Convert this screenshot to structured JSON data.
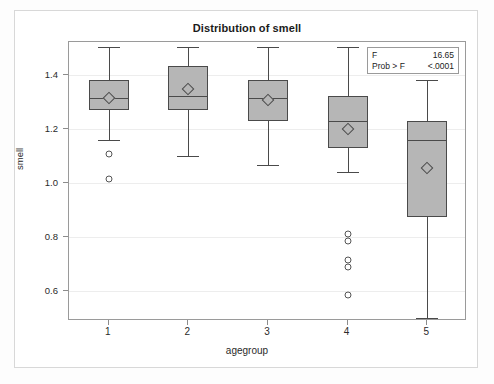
{
  "chart_data": {
    "type": "box",
    "title": "Distribution of smell",
    "xlabel": "agegroup",
    "ylabel": "smell",
    "categories": [
      "1",
      "2",
      "3",
      "4",
      "5"
    ],
    "yticks": [
      0.6,
      0.8,
      1.0,
      1.2,
      1.4
    ],
    "ytick_labels": [
      "0.6",
      "0.8",
      "1.0",
      "1.2",
      "1.4"
    ],
    "ylim": [
      0.49,
      1.52
    ],
    "grid": true,
    "legend": "none",
    "boxes": [
      {
        "category": "1",
        "whisker_low": 1.16,
        "q1": 1.27,
        "median": 1.315,
        "mean": 1.312,
        "q3": 1.38,
        "whisker_high": 1.5,
        "outliers": [
          1.105,
          1.015
        ]
      },
      {
        "category": "2",
        "whisker_low": 1.1,
        "q1": 1.27,
        "median": 1.32,
        "mean": 1.345,
        "q3": 1.43,
        "whisker_high": 1.5,
        "outliers": []
      },
      {
        "category": "3",
        "whisker_low": 1.065,
        "q1": 1.23,
        "median": 1.315,
        "mean": 1.305,
        "q3": 1.38,
        "whisker_high": 1.5,
        "outliers": []
      },
      {
        "category": "4",
        "whisker_low": 1.04,
        "q1": 1.13,
        "median": 1.23,
        "mean": 1.2,
        "q3": 1.32,
        "whisker_high": 1.5,
        "outliers": [
          0.81,
          0.785,
          0.715,
          0.69,
          0.585
        ]
      },
      {
        "category": "5",
        "whisker_low": 0.5,
        "q1": 0.875,
        "median": 1.16,
        "mean": 1.055,
        "q3": 1.23,
        "whisker_high": 1.38,
        "outliers": []
      }
    ],
    "annotation": {
      "rows": [
        {
          "key": "F",
          "value": "16.65"
        },
        {
          "key": "Prob > F",
          "value": "<.0001"
        }
      ]
    },
    "colors": {
      "box_fill": "#b6b6b6",
      "box_line": "#4a4a4a",
      "grid": "#ededed",
      "frame": "#9a9a9a",
      "text": "#1b1b1b"
    }
  }
}
